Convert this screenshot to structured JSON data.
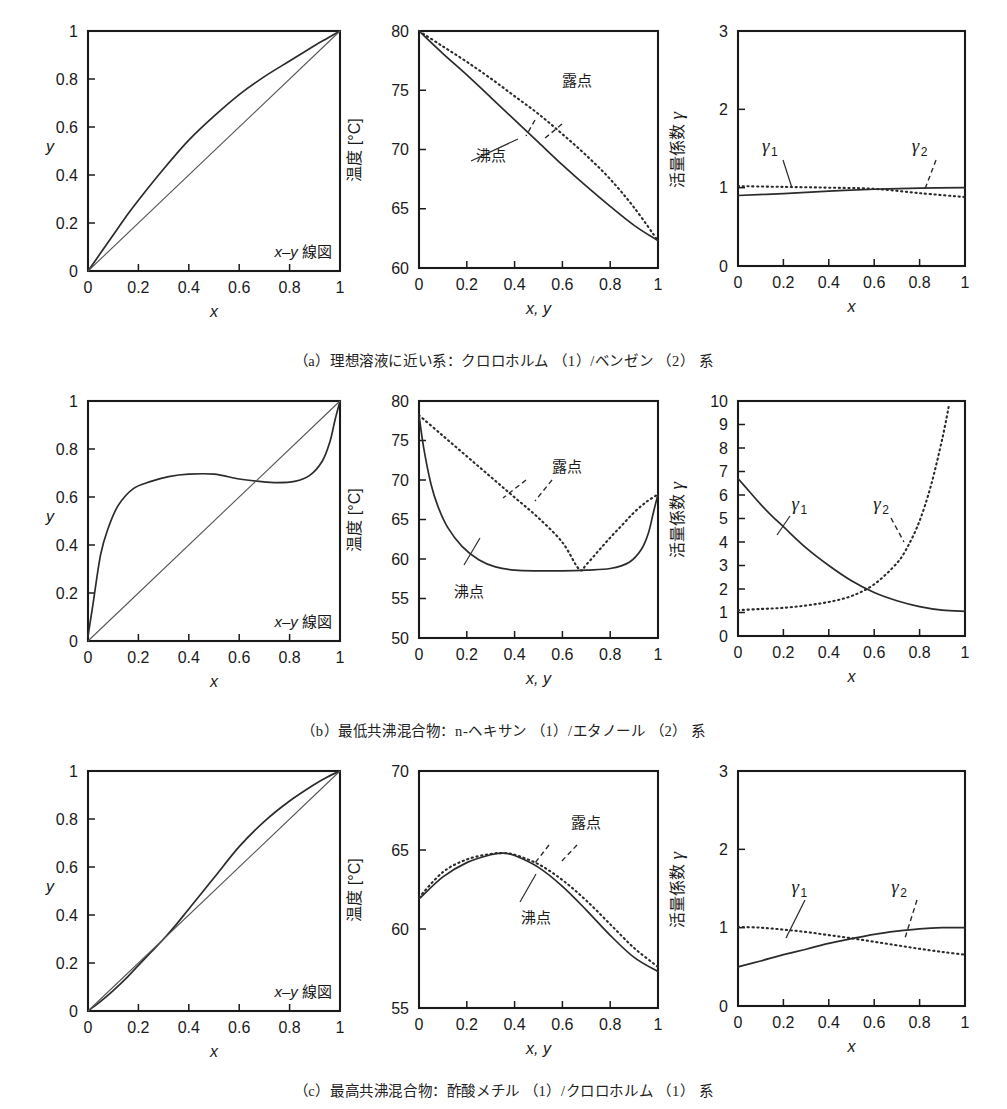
{
  "figure": {
    "title_absent": true,
    "rows": [
      {
        "id": "a",
        "caption": "（a）理想溶液に近い系：クロロホルム （1）/ベンゼン （2） 系",
        "panels": [
          "xy",
          "txy",
          "gamma"
        ]
      },
      {
        "id": "b",
        "caption": "（b）最低共沸混合物：n-ヘキサン （1）/エタノール （2） 系",
        "panels": [
          "xy",
          "txy",
          "gamma"
        ]
      },
      {
        "id": "c",
        "caption": "（c）最高共沸混合物：酢酸メチル （1）/クロロホルム （1） 系",
        "panels": [
          "xy",
          "txy",
          "gamma"
        ]
      }
    ]
  },
  "labels": {
    "x": "x",
    "y": "y",
    "xy": "x, y",
    "temperature": "温度 [°C]",
    "activity": "活量係数",
    "gamma": "γ",
    "gamma1_sub": "1",
    "gamma2_sub": "2",
    "xy_diagram": "x–y 線図",
    "dew_point": "露点",
    "boiling_point": "沸点"
  },
  "colors": {
    "axis": "#1a1a1a",
    "curve": "#2b2b2b",
    "diagonal": "#555555",
    "background": "#ffffff"
  },
  "chart_data": [
    {
      "id": "a-xy",
      "type": "line",
      "title": "x–y 線図",
      "xlabel": "x",
      "ylabel": "y",
      "xlim": [
        0,
        1
      ],
      "ylim": [
        0,
        1
      ],
      "xticks": [
        0,
        0.2,
        0.4,
        0.6,
        0.8,
        1
      ],
      "yticks": [
        0,
        0.2,
        0.4,
        0.6,
        0.8,
        1
      ],
      "xticklabels": [
        "0",
        "0.2",
        "0.4",
        "0.6",
        "0.8",
        "1"
      ],
      "yticklabels": [
        "0",
        "0.2",
        "0.4",
        "0.6",
        "0.8",
        "1"
      ],
      "grid": false,
      "legend": "none",
      "series": [
        {
          "name": "equilibrium",
          "style": "solid",
          "x": [
            0,
            0.05,
            0.1,
            0.15,
            0.2,
            0.3,
            0.4,
            0.5,
            0.6,
            0.7,
            0.8,
            0.9,
            0.95,
            1
          ],
          "y": [
            0,
            0.075,
            0.15,
            0.225,
            0.295,
            0.425,
            0.545,
            0.645,
            0.735,
            0.81,
            0.875,
            0.94,
            0.97,
            1
          ]
        },
        {
          "name": "y=x",
          "style": "thin-solid",
          "x": [
            0,
            1
          ],
          "y": [
            0,
            1
          ]
        }
      ]
    },
    {
      "id": "a-txy",
      "type": "line",
      "xlabel": "x, y",
      "ylabel": "温度 [°C]",
      "xlim": [
        0,
        1
      ],
      "ylim": [
        60,
        80
      ],
      "xticks": [
        0,
        0.2,
        0.4,
        0.6,
        0.8,
        1
      ],
      "yticks": [
        60,
        65,
        70,
        75,
        80
      ],
      "xticklabels": [
        "0",
        "0.2",
        "0.4",
        "0.6",
        "0.8",
        "1"
      ],
      "yticklabels": [
        "60",
        "65",
        "70",
        "75",
        "80"
      ],
      "grid": false,
      "annotations": [
        {
          "text": "露点",
          "x": 0.66,
          "y": 75.4
        },
        {
          "text": "沸点",
          "x": 0.3,
          "y": 69.0
        }
      ],
      "series": [
        {
          "name": "露点 (dew point)",
          "style": "dotted",
          "x": [
            0,
            0.1,
            0.2,
            0.3,
            0.4,
            0.5,
            0.6,
            0.7,
            0.8,
            0.9,
            1
          ],
          "y": [
            80.0,
            78.7,
            77.4,
            76.0,
            74.5,
            73.0,
            71.3,
            69.5,
            67.5,
            65.1,
            62.3
          ]
        },
        {
          "name": "沸点 (bubble point)",
          "style": "solid",
          "x": [
            0,
            0.1,
            0.2,
            0.3,
            0.4,
            0.5,
            0.6,
            0.7,
            0.8,
            0.9,
            1
          ],
          "y": [
            80.0,
            78.1,
            76.3,
            74.4,
            72.5,
            70.6,
            68.7,
            66.9,
            65.2,
            63.6,
            62.3
          ]
        }
      ]
    },
    {
      "id": "a-gamma",
      "type": "line",
      "xlabel": "x",
      "ylabel": "活量係数 γ",
      "xlim": [
        0,
        1
      ],
      "ylim": [
        0,
        3
      ],
      "xticks": [
        0,
        0.2,
        0.4,
        0.6,
        0.8,
        1
      ],
      "yticks": [
        0,
        1,
        2,
        3
      ],
      "xticklabels": [
        "0",
        "0.2",
        "0.4",
        "0.6",
        "0.8",
        "1"
      ],
      "yticklabels": [
        "0",
        "1",
        "2",
        "3"
      ],
      "grid": false,
      "annotations": [
        {
          "text": "γ1",
          "x": 0.14,
          "y": 1.45
        },
        {
          "text": "γ2",
          "x": 0.8,
          "y": 1.45
        }
      ],
      "series": [
        {
          "name": "γ1",
          "style": "solid",
          "x": [
            0,
            0.2,
            0.4,
            0.6,
            0.8,
            1
          ],
          "y": [
            0.9,
            0.925,
            0.955,
            0.98,
            0.995,
            1.0
          ]
        },
        {
          "name": "γ2",
          "style": "dotted",
          "x": [
            0,
            0.2,
            0.4,
            0.6,
            0.8,
            1
          ],
          "y": [
            1.02,
            1.01,
            1.0,
            0.985,
            0.93,
            0.88
          ]
        }
      ]
    },
    {
      "id": "b-xy",
      "type": "line",
      "title": "x–y 線図",
      "xlabel": "x",
      "ylabel": "y",
      "xlim": [
        0,
        1
      ],
      "ylim": [
        0,
        1
      ],
      "xticks": [
        0,
        0.2,
        0.4,
        0.6,
        0.8,
        1
      ],
      "yticks": [
        0,
        0.2,
        0.4,
        0.6,
        0.8,
        1
      ],
      "xticklabels": [
        "0",
        "0.2",
        "0.4",
        "0.6",
        "0.8",
        "1"
      ],
      "yticklabels": [
        "0",
        "0.2",
        "0.4",
        "0.6",
        "0.8",
        "1"
      ],
      "grid": false,
      "series": [
        {
          "name": "equilibrium",
          "style": "solid",
          "x": [
            0,
            0.02,
            0.05,
            0.08,
            0.12,
            0.18,
            0.25,
            0.32,
            0.4,
            0.5,
            0.6,
            0.68,
            0.75,
            0.82,
            0.88,
            0.93,
            0.96,
            0.98,
            1
          ],
          "y": [
            0.02,
            0.155,
            0.36,
            0.47,
            0.565,
            0.635,
            0.665,
            0.685,
            0.695,
            0.695,
            0.675,
            0.665,
            0.66,
            0.665,
            0.69,
            0.75,
            0.83,
            0.92,
            1.0
          ]
        },
        {
          "name": "y=x",
          "style": "thin-solid",
          "x": [
            0,
            1
          ],
          "y": [
            0,
            1
          ]
        }
      ]
    },
    {
      "id": "b-txy",
      "type": "line",
      "xlabel": "x, y",
      "ylabel": "温度 [°C]",
      "xlim": [
        0,
        1
      ],
      "ylim": [
        50,
        80
      ],
      "xticks": [
        0,
        0.2,
        0.4,
        0.6,
        0.8,
        1
      ],
      "yticks": [
        50,
        55,
        60,
        65,
        70,
        75,
        80
      ],
      "xticklabels": [
        "0",
        "0.2",
        "0.4",
        "0.6",
        "0.8",
        "1"
      ],
      "yticklabels": [
        "50",
        "55",
        "60",
        "65",
        "70",
        "75",
        "80"
      ],
      "grid": false,
      "annotations": [
        {
          "text": "露点",
          "x": 0.62,
          "y": 71.0
        },
        {
          "text": "沸点",
          "x": 0.21,
          "y": 55.2
        }
      ],
      "series": [
        {
          "name": "露点 (dew point)",
          "style": "dotted",
          "x": [
            0,
            0.1,
            0.2,
            0.3,
            0.4,
            0.5,
            0.6,
            0.67,
            0.7,
            0.75,
            0.8,
            0.85,
            0.9,
            0.95,
            1
          ],
          "y": [
            78.2,
            75.6,
            73.0,
            70.4,
            67.8,
            65.2,
            62.1,
            58.7,
            59.3,
            61.0,
            62.7,
            64.3,
            65.9,
            67.2,
            68.2
          ]
        },
        {
          "name": "沸点 (bubble point)",
          "style": "solid",
          "x": [
            0,
            0.02,
            0.05,
            0.08,
            0.12,
            0.18,
            0.25,
            0.32,
            0.4,
            0.5,
            0.6,
            0.7,
            0.8,
            0.88,
            0.93,
            0.96,
            0.98,
            1
          ],
          "y": [
            78.2,
            74.0,
            69.5,
            66.6,
            64.0,
            61.6,
            59.9,
            59.0,
            58.6,
            58.5,
            58.5,
            58.6,
            58.8,
            59.6,
            61.2,
            63.3,
            65.8,
            68.2
          ]
        }
      ]
    },
    {
      "id": "b-gamma",
      "type": "line",
      "xlabel": "x",
      "ylabel": "活量係数 γ",
      "xlim": [
        0,
        1
      ],
      "ylim": [
        0,
        10
      ],
      "xticks": [
        0,
        0.2,
        0.4,
        0.6,
        0.8,
        1
      ],
      "yticks": [
        0,
        1,
        2,
        3,
        4,
        5,
        6,
        7,
        8,
        9,
        10
      ],
      "xticklabels": [
        "0",
        "0.2",
        "0.4",
        "0.6",
        "0.8",
        "1"
      ],
      "yticklabels": [
        "0",
        "1",
        "2",
        "3",
        "4",
        "5",
        "6",
        "7",
        "8",
        "9",
        "10"
      ],
      "grid": false,
      "annotations": [
        {
          "text": "γ1",
          "x": 0.27,
          "y": 5.35
        },
        {
          "text": "γ2",
          "x": 0.63,
          "y": 5.35
        }
      ],
      "series": [
        {
          "name": "γ1",
          "style": "solid",
          "x": [
            0,
            0.05,
            0.1,
            0.15,
            0.2,
            0.3,
            0.4,
            0.5,
            0.6,
            0.7,
            0.8,
            0.9,
            1
          ],
          "y": [
            6.7,
            6.15,
            5.6,
            5.1,
            4.65,
            3.75,
            3.0,
            2.35,
            1.85,
            1.5,
            1.25,
            1.1,
            1.05
          ]
        },
        {
          "name": "γ2",
          "style": "dotted",
          "x": [
            0,
            0.1,
            0.2,
            0.3,
            0.4,
            0.5,
            0.6,
            0.7,
            0.75,
            0.8,
            0.85,
            0.9,
            0.93
          ],
          "y": [
            1.1,
            1.15,
            1.2,
            1.3,
            1.45,
            1.7,
            2.2,
            3.1,
            3.85,
            4.9,
            6.4,
            8.4,
            9.85
          ]
        }
      ]
    },
    {
      "id": "c-xy",
      "type": "line",
      "title": "x–y 線図",
      "xlabel": "x",
      "ylabel": "y",
      "xlim": [
        0,
        1
      ],
      "ylim": [
        0,
        1
      ],
      "xticks": [
        0,
        0.2,
        0.4,
        0.6,
        0.8,
        1
      ],
      "yticks": [
        0,
        0.2,
        0.4,
        0.6,
        0.8,
        1
      ],
      "xticklabels": [
        "0",
        "0.2",
        "0.4",
        "0.6",
        "0.8",
        "1"
      ],
      "yticklabels": [
        "0",
        "0.2",
        "0.4",
        "0.6",
        "0.8",
        "1"
      ],
      "grid": false,
      "series": [
        {
          "name": "equilibrium",
          "style": "solid",
          "x": [
            0,
            0.05,
            0.1,
            0.15,
            0.2,
            0.25,
            0.3,
            0.35,
            0.4,
            0.5,
            0.6,
            0.7,
            0.8,
            0.9,
            0.95,
            1
          ],
          "y": [
            0,
            0.04,
            0.085,
            0.135,
            0.19,
            0.245,
            0.3,
            0.36,
            0.425,
            0.555,
            0.685,
            0.79,
            0.875,
            0.945,
            0.975,
            1
          ]
        },
        {
          "name": "y=x",
          "style": "thin-solid",
          "x": [
            0,
            1
          ],
          "y": [
            0,
            1
          ]
        }
      ]
    },
    {
      "id": "c-txy",
      "type": "line",
      "xlabel": "x, y",
      "ylabel": "温度 [°C]",
      "xlim": [
        0,
        1
      ],
      "ylim": [
        55,
        70
      ],
      "xticks": [
        0,
        0.2,
        0.4,
        0.6,
        0.8,
        1
      ],
      "yticks": [
        55,
        60,
        65,
        70
      ],
      "xticklabels": [
        "0",
        "0.2",
        "0.4",
        "0.6",
        "0.8",
        "1"
      ],
      "yticklabels": [
        "55",
        "60",
        "65",
        "70"
      ],
      "grid": false,
      "annotations": [
        {
          "text": "露点",
          "x": 0.7,
          "y": 66.4
        },
        {
          "text": "沸点",
          "x": 0.49,
          "y": 60.4
        }
      ],
      "series": [
        {
          "name": "露点 (dew point)",
          "style": "dotted",
          "x": [
            0,
            0.1,
            0.2,
            0.3,
            0.35,
            0.4,
            0.5,
            0.6,
            0.7,
            0.8,
            0.9,
            1
          ],
          "y": [
            62.0,
            63.6,
            64.4,
            64.75,
            64.8,
            64.7,
            64.1,
            63.1,
            61.8,
            60.3,
            58.8,
            57.6
          ]
        },
        {
          "name": "沸点 (bubble point)",
          "style": "solid",
          "x": [
            0,
            0.1,
            0.2,
            0.3,
            0.35,
            0.4,
            0.5,
            0.6,
            0.7,
            0.8,
            0.9,
            1
          ],
          "y": [
            61.9,
            63.3,
            64.2,
            64.7,
            64.8,
            64.65,
            63.9,
            62.7,
            61.2,
            59.6,
            58.2,
            57.3
          ]
        }
      ]
    },
    {
      "id": "c-gamma",
      "type": "line",
      "xlabel": "x",
      "ylabel": "活量係数 γ",
      "xlim": [
        0,
        1
      ],
      "ylim": [
        0,
        3
      ],
      "xticks": [
        0,
        0.2,
        0.4,
        0.6,
        0.8,
        1
      ],
      "yticks": [
        0,
        1,
        2,
        3
      ],
      "xticklabels": [
        "0",
        "0.2",
        "0.4",
        "0.6",
        "0.8",
        "1"
      ],
      "yticklabels": [
        "0",
        "1",
        "2",
        "3"
      ],
      "grid": false,
      "annotations": [
        {
          "text": "γ1",
          "x": 0.27,
          "y": 1.44
        },
        {
          "text": "γ2",
          "x": 0.71,
          "y": 1.44
        }
      ],
      "series": [
        {
          "name": "γ1",
          "style": "solid",
          "x": [
            0,
            0.1,
            0.2,
            0.3,
            0.4,
            0.5,
            0.6,
            0.7,
            0.8,
            0.9,
            1
          ],
          "y": [
            0.5,
            0.575,
            0.655,
            0.725,
            0.8,
            0.86,
            0.915,
            0.955,
            0.985,
            1.0,
            1.0
          ]
        },
        {
          "name": "γ2",
          "style": "dotted",
          "x": [
            0,
            0.1,
            0.2,
            0.3,
            0.4,
            0.5,
            0.6,
            0.7,
            0.8,
            0.9,
            1
          ],
          "y": [
            1.01,
            1.0,
            0.975,
            0.945,
            0.905,
            0.865,
            0.82,
            0.775,
            0.73,
            0.69,
            0.655
          ]
        }
      ]
    }
  ]
}
